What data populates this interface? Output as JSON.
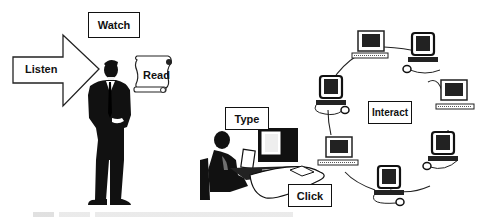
{
  "labels": {
    "watch": "Watch",
    "listen": "Listen",
    "read": "Read",
    "type": "Type",
    "click": "Click",
    "interact": "Interact"
  },
  "figure": {
    "left_scene": "person standing with arrow and scroll",
    "right_scene": "person at computer connected to a ring of networked computers",
    "network_node_count": 8
  },
  "caption": ""
}
